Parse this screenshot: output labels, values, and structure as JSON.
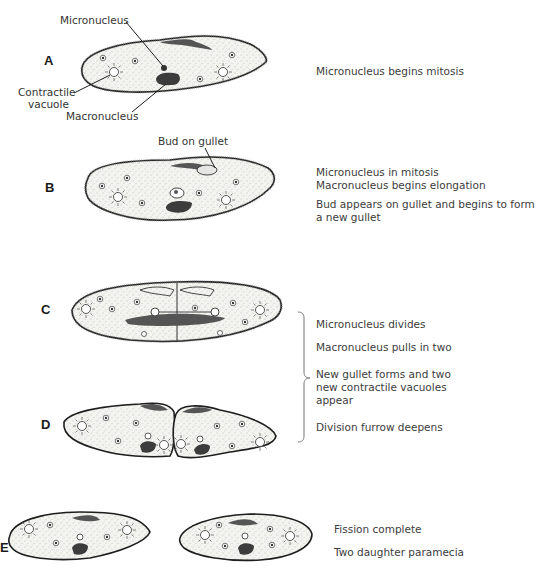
{
  "figure": {
    "type": "paramecium binary fission diagram",
    "stages": [
      {
        "id": "A",
        "label": "A",
        "callouts": {
          "micronucleus": "Micronucleus",
          "contractile_vacuole": [
            "Contractile",
            "vacuole"
          ],
          "macronucleus": "Macronucleus"
        },
        "description": [
          "Micronucleus begins mitosis"
        ]
      },
      {
        "id": "B",
        "label": "B",
        "callouts": {
          "bud_on_gullet": "Bud on gullet"
        },
        "description": [
          "Micronucleus in mitosis",
          "Macronucleus begins elongation",
          "Bud appears on gullet and begins to form",
          "a new gullet"
        ]
      },
      {
        "id": "C",
        "label": "C",
        "description": []
      },
      {
        "id": "D",
        "label": "D",
        "description": []
      },
      {
        "id": "E",
        "label": "E",
        "description": [
          "Fission complete",
          "Two daughter paramecia"
        ]
      }
    ],
    "bracket_cd": {
      "description": [
        "Micronucleus divides",
        "Macronucleus pulls in two",
        "New gullet forms and two",
        "new contractile vacuoles",
        "appear",
        "Division furrow deepens"
      ]
    },
    "colors": {
      "ink": "#1e1e1e",
      "cell_fill": "#f1f1ee",
      "nucleus": "#3c3c3c",
      "text": "#3c3c3c"
    }
  }
}
